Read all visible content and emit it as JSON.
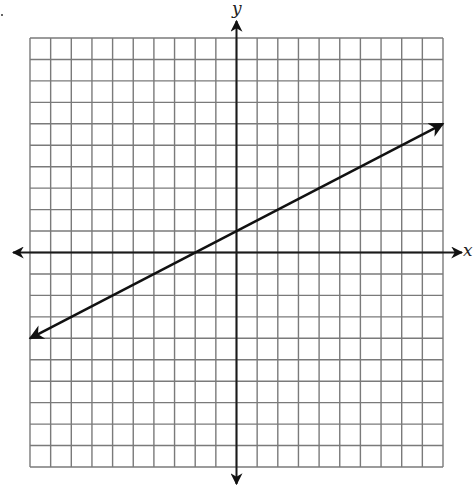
{
  "chart_data": {
    "type": "line",
    "title": "",
    "xlabel": "x",
    "ylabel": "y",
    "xlim": [
      -10,
      10
    ],
    "ylim": [
      -10,
      10
    ],
    "grid": true,
    "grid_step": 1,
    "axes_arrows": true,
    "tick_labels": false,
    "series": [
      {
        "name": "line",
        "equation": "y = (1/2)x + 1",
        "slope": 0.5,
        "intercept": 1,
        "x": [
          -10,
          -2,
          0,
          10
        ],
        "y": [
          -4,
          0,
          1,
          6
        ],
        "arrows_both_ends": true
      }
    ]
  },
  "labels": {
    "x_axis": "x",
    "y_axis": "y"
  },
  "colors": {
    "grid": "#7a7a7a",
    "axes": "#1a1a1a",
    "line": "#111111",
    "background": "#ffffff"
  }
}
